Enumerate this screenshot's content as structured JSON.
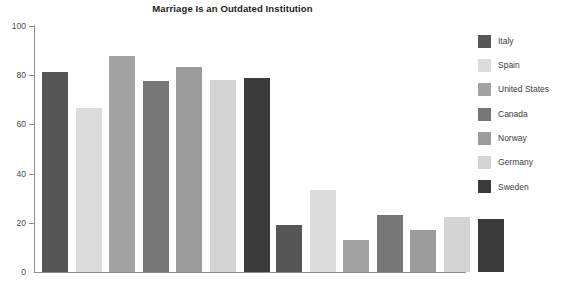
{
  "chart_data": {
    "type": "bar",
    "title": "Marriage Is an Outdated Institution",
    "xlabel": "",
    "ylabel": "",
    "ylim": [
      0,
      100
    ],
    "yticks": [
      0,
      20,
      40,
      60,
      80,
      100
    ],
    "grid": false,
    "legend_position": "right",
    "categories": [
      "Group 1",
      "Group 2"
    ],
    "series": [
      {
        "name": "Italy",
        "color": "#565656",
        "values": [
          81.5,
          19.2
        ]
      },
      {
        "name": "Spain",
        "color": "#dcdcdc",
        "values": [
          66.8,
          33.3
        ]
      },
      {
        "name": "United States",
        "color": "#a3a3a3",
        "values": [
          87.8,
          13.0
        ]
      },
      {
        "name": "Canada",
        "color": "#777777",
        "values": [
          77.8,
          23.0
        ]
      },
      {
        "name": "Norway",
        "color": "#9b9b9b",
        "values": [
          83.2,
          17.1
        ]
      },
      {
        "name": "Germany",
        "color": "#d4d4d4",
        "values": [
          78.2,
          22.2
        ]
      },
      {
        "name": "Sweden",
        "color": "#3b3b3b",
        "values": [
          79.0,
          21.5
        ]
      }
    ]
  },
  "axis": {
    "tick_labels": [
      "100",
      "80",
      "60",
      "40",
      "20",
      "0"
    ]
  },
  "legend": {
    "items": [
      {
        "label": "Italy"
      },
      {
        "label": "Spain"
      },
      {
        "label": "United States"
      },
      {
        "label": "Canada"
      },
      {
        "label": "Norway"
      },
      {
        "label": "Germany"
      },
      {
        "label": "Sweden"
      }
    ]
  }
}
